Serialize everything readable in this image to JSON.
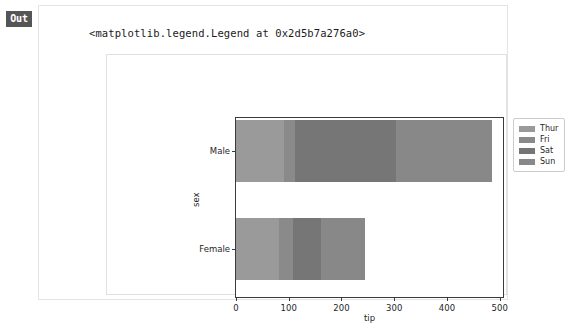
{
  "cell": {
    "prompt_label": "Out",
    "repr_text": "<matplotlib.legend.Legend at 0x2d5b7a276a0>"
  },
  "chart_data": {
    "type": "bar",
    "orientation": "horizontal",
    "stacked": true,
    "title": "",
    "xlabel": "tip",
    "ylabel": "sex",
    "categories": [
      "Male",
      "Female"
    ],
    "xlim": [
      0,
      510
    ],
    "xticks": [
      0,
      100,
      200,
      300,
      400,
      500
    ],
    "xtick_labels": [
      "0",
      "100",
      "200",
      "300",
      "400",
      "500"
    ],
    "grid": false,
    "legend_position": "upper right",
    "series": [
      {
        "name": "Thur",
        "color": "#9a9a9a",
        "values": [
          91,
          82
        ]
      },
      {
        "name": "Fri",
        "color": "#8a8a8a",
        "values": [
          20,
          26
        ]
      },
      {
        "name": "Sat",
        "color": "#767676",
        "values": [
          192,
          54
        ]
      },
      {
        "name": "Sun",
        "color": "#888888",
        "values": [
          182,
          83
        ]
      }
    ],
    "totals": [
      485,
      245
    ]
  }
}
